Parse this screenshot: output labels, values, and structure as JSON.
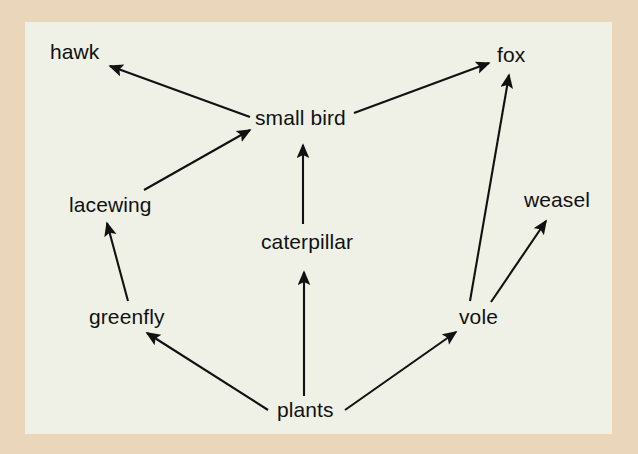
{
  "figure": {
    "type": "food-web-diagram",
    "background_color": "#e9d6bb",
    "panel_color": "#eff1e7",
    "line_color": "#111111",
    "text_color": "#111111"
  },
  "nodes": [
    {
      "id": "hawk",
      "label": "hawk",
      "x": 50,
      "y": 41
    },
    {
      "id": "fox",
      "label": "fox",
      "x": 497,
      "y": 44
    },
    {
      "id": "small_bird",
      "label": "small bird",
      "x": 255,
      "y": 107
    },
    {
      "id": "lacewing",
      "label": "lacewing",
      "x": 69,
      "y": 194
    },
    {
      "id": "weasel",
      "label": "weasel",
      "x": 524,
      "y": 189
    },
    {
      "id": "caterpillar",
      "label": "caterpillar",
      "x": 261,
      "y": 231
    },
    {
      "id": "greenfly",
      "label": "greenfly",
      "x": 89,
      "y": 306
    },
    {
      "id": "vole",
      "label": "vole",
      "x": 459,
      "y": 306
    },
    {
      "id": "plants",
      "label": "plants",
      "x": 277,
      "y": 399
    }
  ],
  "edges": [
    {
      "id": "small_bird-hawk",
      "from": "small bird",
      "to": "hawk",
      "x1": 250,
      "y1": 117,
      "x2": 110,
      "y2": 66
    },
    {
      "id": "lacewing-small_bird",
      "from": "lacewing",
      "to": "small bird",
      "x1": 144,
      "y1": 190,
      "x2": 250,
      "y2": 130
    },
    {
      "id": "small_bird-fox",
      "from": "small bird",
      "to": "fox",
      "x1": 354,
      "y1": 113,
      "x2": 489,
      "y2": 63
    },
    {
      "id": "caterpillar-small_bird",
      "from": "caterpillar",
      "to": "small bird",
      "x1": 303,
      "y1": 224,
      "x2": 303,
      "y2": 145
    },
    {
      "id": "greenfly-lacewing",
      "from": "greenfly",
      "to": "lacewing",
      "x1": 128,
      "y1": 301,
      "x2": 107,
      "y2": 223
    },
    {
      "id": "plants-caterpillar",
      "from": "plants",
      "to": "caterpillar",
      "x1": 304,
      "y1": 396,
      "x2": 304,
      "y2": 272
    },
    {
      "id": "plants-greenfly",
      "from": "plants",
      "to": "greenfly",
      "x1": 268,
      "y1": 410,
      "x2": 147,
      "y2": 333
    },
    {
      "id": "plants-vole",
      "from": "plants",
      "to": "vole",
      "x1": 345,
      "y1": 410,
      "x2": 456,
      "y2": 332
    },
    {
      "id": "vole-fox",
      "from": "vole",
      "to": "fox",
      "x1": 470,
      "y1": 301,
      "x2": 509,
      "y2": 75
    },
    {
      "id": "vole-weasel",
      "from": "vole",
      "to": "weasel",
      "x1": 491,
      "y1": 302,
      "x2": 546,
      "y2": 221
    }
  ]
}
